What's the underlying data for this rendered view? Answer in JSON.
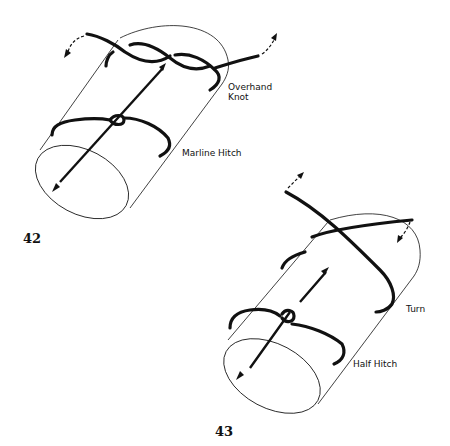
{
  "figures": [
    {
      "number": "42",
      "labels": {
        "knot_line1": "Overhand",
        "knot_line2": "Knot",
        "hitch": "Marline Hitch"
      }
    },
    {
      "number": "43",
      "labels": {
        "turn": "Turn",
        "hitch": "Half Hitch"
      }
    }
  ]
}
